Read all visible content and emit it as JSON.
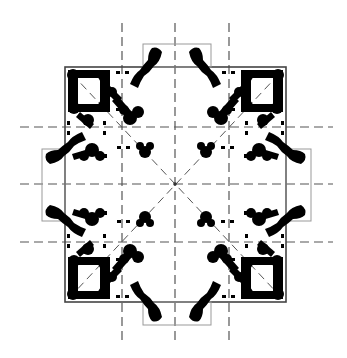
{
  "diagram": {
    "type": "architectural-floor-plan",
    "center": [
      175,
      184
    ],
    "outer_square": {
      "x1": 65,
      "y1": 67,
      "x2": 286,
      "y2": 302
    },
    "projections": {
      "top": {
        "x1": 143,
        "y1": 44,
        "x2": 211,
        "y2": 67
      },
      "bottom": {
        "x1": 143,
        "y1": 302,
        "x2": 211,
        "y2": 325
      },
      "left": {
        "x1": 42,
        "y1": 149,
        "x2": 65,
        "y2": 221
      },
      "right": {
        "x1": 286,
        "y1": 149,
        "x2": 311,
        "y2": 221
      }
    },
    "vertical_axes_x": [
      122,
      175,
      229
    ],
    "horizontal_axes_y": [
      127,
      184,
      242
    ],
    "axis_extent": {
      "x_min": 20,
      "x_max": 333,
      "y_min": 23,
      "y_max": 343
    },
    "colors": {
      "wall": "#000000",
      "axis": "#555555",
      "outline": "#444444",
      "projection": "#999999",
      "background": "#ffffff"
    }
  }
}
